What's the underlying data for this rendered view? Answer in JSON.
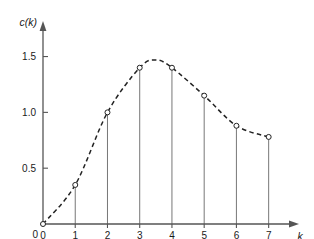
{
  "figure": {
    "background_color": "#ffffff",
    "axis_color": "#555555",
    "curve_color": "#222222",
    "stem_color": "#777777",
    "marker_fill": "#ffffff",
    "marker_stroke": "#222222"
  },
  "chart_data": {
    "type": "line",
    "title": "",
    "subtitle": "",
    "xlabel": "k",
    "ylabel": "c(k)",
    "xlim": [
      0,
      7.6
    ],
    "ylim": [
      0,
      1.72
    ],
    "grid": false,
    "legend": null,
    "style": "stem-plot with dashed interpolating curve and open circle markers",
    "x": [
      0,
      1,
      2,
      3,
      4,
      5,
      6,
      7
    ],
    "values": [
      0.0,
      0.35,
      1.0,
      1.4,
      1.4,
      1.15,
      0.88,
      0.78
    ],
    "xticks": [
      0,
      1,
      2,
      3,
      4,
      5,
      6,
      7
    ],
    "xticklabels": [
      "0",
      "1",
      "2",
      "3",
      "4",
      "5",
      "6",
      "7"
    ],
    "yticks": [
      0,
      0.5,
      1.0,
      1.5
    ],
    "yticklabels": [
      "0",
      "0.5",
      "1.0",
      "1.5"
    ],
    "curve_peak": {
      "x": 3.5,
      "y": 1.47
    },
    "annotations": []
  },
  "axes": {
    "x_arrow": "arrowhead-right",
    "y_arrow": "arrowhead-up",
    "x_label_text": "k",
    "y_label_text": "c(k)"
  }
}
